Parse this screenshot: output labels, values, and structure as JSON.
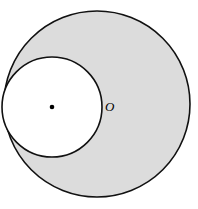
{
  "figure": {
    "background_color": "#ffffff",
    "width": 198,
    "height": 209,
    "stroke_color": "#111111",
    "stroke_width": 1.6,
    "outer_circle": {
      "name": "outer-circle",
      "center_x": 97,
      "center_y": 104,
      "radius": 93,
      "fill_color": "#dcdcdc",
      "filled": true
    },
    "inner_circle": {
      "name": "inner-circle",
      "center_x": 52,
      "center_y": 107,
      "radius": 50,
      "fill_color": "#ffffff",
      "filled": true
    },
    "center_dot": {
      "name": "inner-circle-center-dot",
      "x": 52,
      "y": 107,
      "radius": 2.3,
      "color": "#000000"
    },
    "labels": [
      {
        "name": "label-O",
        "text": "O",
        "x": 105,
        "y": 111,
        "style": "italic"
      }
    ]
  }
}
